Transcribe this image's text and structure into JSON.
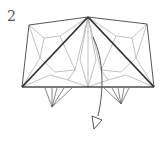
{
  "diagram": {
    "step_number": "2",
    "type": "origami folding step",
    "colors": {
      "outline": "#444444",
      "crease": "#888888",
      "valley_fold_heavy": "#333333",
      "background": "#ffffff"
    },
    "elements": [
      "paper-model-outline",
      "heavy-diagonal-left",
      "heavy-diagonal-right",
      "crease-lines",
      "left-hanging-flap",
      "right-hanging-flap",
      "fold-down-arrow"
    ]
  }
}
